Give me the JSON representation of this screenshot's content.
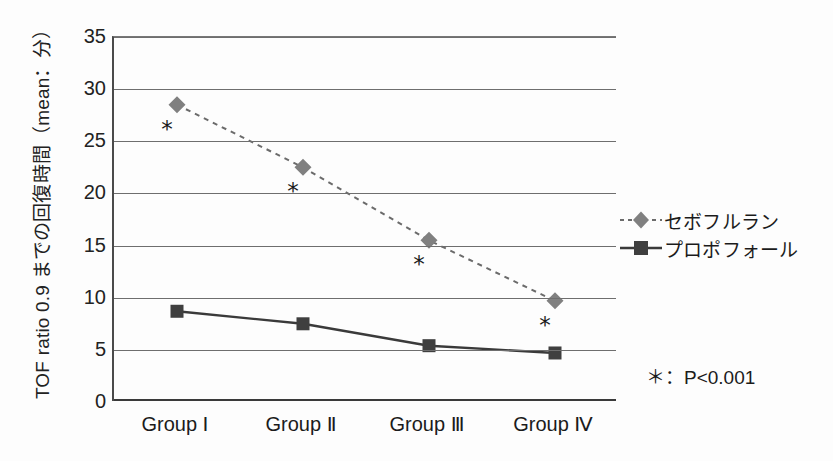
{
  "chart_data": {
    "type": "line",
    "title": "",
    "xlabel": "",
    "ylabel": "TOF ratio 0.9 までの回復時間（mean：分）",
    "categories": [
      "Group Ⅰ",
      "Group Ⅱ",
      "Group Ⅲ",
      "Group Ⅳ"
    ],
    "ylim": [
      0,
      35
    ],
    "ytick_step": 5,
    "yticks": [
      "35",
      "30",
      "25",
      "20",
      "15",
      "10",
      "5",
      "0"
    ],
    "grid": true,
    "legend_position": "right",
    "series": [
      {
        "name": "セボフルラン",
        "values": [
          28.5,
          22.5,
          15.5,
          9.7
        ],
        "marker": "diamond",
        "linestyle": "dashed",
        "color": "#808080",
        "line_color": "#6b6b6b",
        "significance": [
          "＊",
          "＊",
          "＊",
          "＊"
        ]
      },
      {
        "name": "プロポフォール",
        "values": [
          8.7,
          7.5,
          5.4,
          4.7
        ],
        "marker": "square",
        "linestyle": "solid",
        "color": "#3f3f3f",
        "line_color": "#3a3a3a",
        "significance": [
          "",
          "",
          "",
          ""
        ]
      }
    ],
    "annotations": [
      {
        "name": "p-value-note",
        "text": "＊：P<0.001"
      }
    ]
  },
  "legend": {
    "items": [
      {
        "label": "セボフルラン",
        "marker": "diamond-marker",
        "linestyle": "dashed"
      },
      {
        "label": "プロポフォール",
        "marker": "square-marker",
        "linestyle": "solid"
      }
    ]
  },
  "notes": {
    "p_value": "＊：P<0.001"
  },
  "colors": {
    "sevoflurane": "#808080",
    "propofol": "#3f3f3f",
    "grid": "#6e6e6e",
    "axis": "#3a3a3a",
    "background": "#fdfdfd"
  }
}
